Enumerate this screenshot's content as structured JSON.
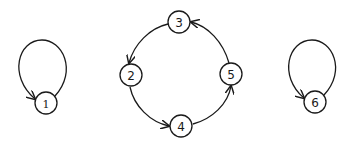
{
  "diagram": {
    "type": "directed-graph",
    "stroke_color": "#1a1a1a",
    "background": "#ffffff",
    "nodes": [
      {
        "id": "1",
        "label": "1",
        "x": 46,
        "y": 103,
        "r": 11
      },
      {
        "id": "2",
        "label": "2",
        "x": 131,
        "y": 75,
        "r": 11
      },
      {
        "id": "3",
        "label": "3",
        "x": 179,
        "y": 22,
        "r": 11
      },
      {
        "id": "4",
        "label": "4",
        "x": 181,
        "y": 126,
        "r": 11
      },
      {
        "id": "5",
        "label": "5",
        "x": 231,
        "y": 74,
        "r": 11
      },
      {
        "id": "6",
        "label": "6",
        "x": 315,
        "y": 102,
        "r": 11
      }
    ],
    "edges": [
      {
        "from": "1",
        "to": "1",
        "kind": "self-loop"
      },
      {
        "from": "3",
        "to": "2"
      },
      {
        "from": "2",
        "to": "4"
      },
      {
        "from": "4",
        "to": "5"
      },
      {
        "from": "5",
        "to": "3"
      },
      {
        "from": "6",
        "to": "6",
        "kind": "self-loop"
      }
    ]
  }
}
